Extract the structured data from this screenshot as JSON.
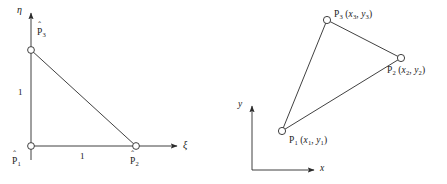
{
  "figure": {
    "caption_present": false,
    "panels": [
      {
        "id": "reference-element",
        "name": "parent-element-xi-eta",
        "axes": {
          "horizontal_label": "ξ",
          "vertical_label": "η"
        },
        "dimensions": {
          "base_length": "1",
          "height_length": "1"
        },
        "nodes": [
          {
            "key": "p1",
            "label_base": "P",
            "label_sub": "1",
            "accent": "ˆ",
            "x": 31,
            "y": 146
          },
          {
            "key": "p2",
            "label_base": "P",
            "label_sub": "2",
            "accent": "ˆ",
            "x": 136,
            "y": 146
          },
          {
            "key": "p3",
            "label_base": "P",
            "label_sub": "3",
            "accent": "ˆ",
            "x": 31,
            "y": 50
          }
        ]
      },
      {
        "id": "physical-element",
        "name": "physical-element-x-y",
        "axes": {
          "horizontal_label": "x",
          "vertical_label": "y"
        },
        "nodes": [
          {
            "key": "p1",
            "label": "P",
            "sub": "1",
            "coords_open": "(",
            "cx": "x",
            "cx_sub": "1",
            "comma": ", ",
            "cy": "y",
            "cy_sub": "1",
            "coords_close": ")",
            "x": 282,
            "y": 131
          },
          {
            "key": "p2",
            "label": "P",
            "sub": "2",
            "coords_open": "(",
            "cx": "x",
            "cx_sub": "2",
            "comma": ", ",
            "cy": "y",
            "cy_sub": "2",
            "coords_close": ")",
            "x": 401,
            "y": 58
          },
          {
            "key": "p3",
            "label": "P",
            "sub": "3",
            "coords_open": "(",
            "cx": "x",
            "cx_sub": "3",
            "comma": ", ",
            "cy": "y",
            "cy_sub": "3",
            "coords_close": ")",
            "x": 327,
            "y": 20
          }
        ]
      }
    ]
  },
  "colors": {
    "stroke": "#2b2b2b",
    "text": "#1a1a1a",
    "background": "#ffffff",
    "node_fill": "#ffffff"
  },
  "labels": {
    "left": {
      "eta": "η",
      "xi": "ξ",
      "p1_base": "P",
      "p1_sub": "1",
      "p2_base": "P",
      "p2_sub": "2",
      "p3_base": "P",
      "p3_sub": "3",
      "hat": "ˆ",
      "dim_vertical": "1",
      "dim_horizontal": "1"
    },
    "right": {
      "y_axis": "y",
      "x_axis": "x",
      "p1_base": "P",
      "p1_sub": "1",
      "p1_coords_prefix": " (",
      "p1_cx": "x",
      "p1_cx_sub": "1",
      "p1_sep": ", ",
      "p1_cy": "y",
      "p1_cy_sub": "1",
      "p1_coords_suffix": ")",
      "p2_base": "P",
      "p2_sub": "2",
      "p2_coords_prefix": " (",
      "p2_cx": "x",
      "p2_cx_sub": "2",
      "p2_sep": ", ",
      "p2_cy": "y",
      "p2_cy_sub": "2",
      "p2_coords_suffix": ")",
      "p3_base": "P",
      "p3_sub": "3",
      "p3_coords_prefix": " (",
      "p3_cx": "x",
      "p3_cx_sub": "3",
      "p3_sep": ", ",
      "p3_cy": "y",
      "p3_cy_sub": "3",
      "p3_coords_suffix": ")"
    }
  }
}
